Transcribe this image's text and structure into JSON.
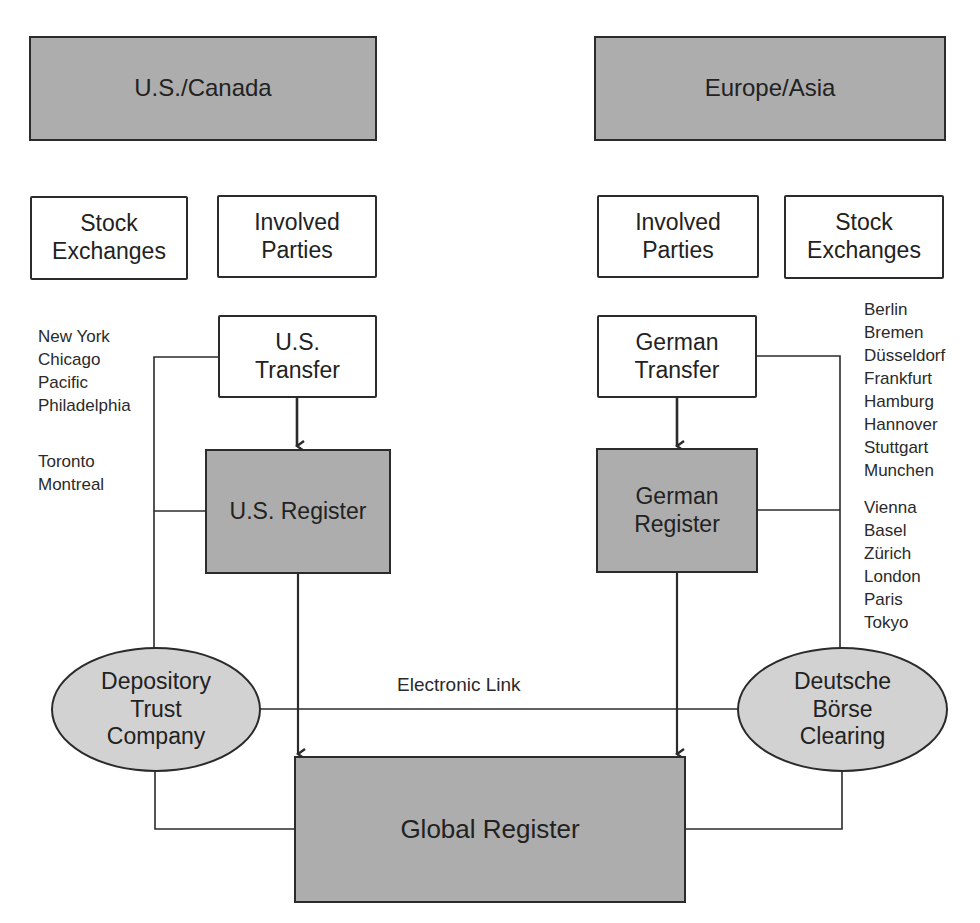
{
  "regions": {
    "left": {
      "label": "U.S./Canada"
    },
    "right": {
      "label": "Europe/Asia"
    }
  },
  "left_side": {
    "stock_exchanges": "Stock\nExchanges",
    "involved_parties": "Involved\nParties",
    "transfer": "U.S.\nTransfer",
    "register": "U.S. Register",
    "depository": "Depository\nTrust\nCompany",
    "cities_group1": [
      "New York",
      "Chicago",
      "Pacific",
      "Philadelphia"
    ],
    "cities_group2": [
      "Toronto",
      "Montreal"
    ]
  },
  "right_side": {
    "involved_parties": "Involved\nParties",
    "stock_exchanges": "Stock\nExchanges",
    "transfer": "German\nTransfer",
    "register": "German\nRegister",
    "depository": "Deutsche\nBörse\nClearing",
    "cities_group1": [
      "Berlin",
      "Bremen",
      "Düsseldorf",
      "Frankfurt",
      "Hamburg",
      "Hannover",
      "Stuttgart",
      "Munchen"
    ],
    "cities_group2": [
      "Vienna",
      "Basel",
      "Zürich",
      "London",
      "Paris",
      "Tokyo"
    ]
  },
  "center": {
    "electronic_link": "Electronic Link",
    "global_register": "Global Register"
  },
  "colors": {
    "dark_fill": "#adadad",
    "ellipse_fill": "#d2d2d2",
    "stroke": "#2b2b2b"
  }
}
